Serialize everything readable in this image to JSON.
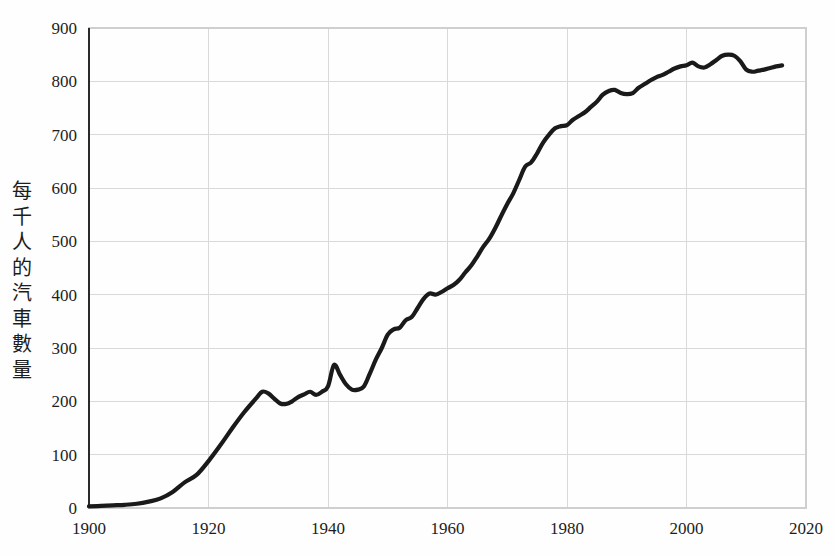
{
  "chart_data": {
    "type": "line",
    "title": "",
    "subtitle": "",
    "xlabel": "",
    "ylabel": "每千人的汽車數量",
    "ylabel_chars": [
      "每",
      "千",
      "人",
      "的",
      "汽",
      "車",
      "數",
      "量"
    ],
    "xlim": [
      1900,
      2020
    ],
    "ylim": [
      0,
      900
    ],
    "grid": true,
    "legend_position": "none",
    "line_color": "#1a1a1a",
    "grid_color": "#d9d9d9",
    "background_color": "#fefefe",
    "xticks": [
      1900,
      1920,
      1940,
      1960,
      1980,
      2000,
      2020
    ],
    "xtick_labels": [
      "1900",
      "1920",
      "1940",
      "1960",
      "1980",
      "2000",
      "2020"
    ],
    "yticks": [
      0,
      100,
      200,
      300,
      400,
      500,
      600,
      700,
      800,
      900
    ],
    "ytick_labels": [
      "0",
      "100",
      "200",
      "300",
      "400",
      "500",
      "600",
      "700",
      "800",
      "900"
    ],
    "series": [
      {
        "name": "每千人的汽車數量",
        "x": [
          1900,
          1902,
          1904,
          1906,
          1908,
          1910,
          1912,
          1914,
          1916,
          1918,
          1920,
          1922,
          1924,
          1926,
          1928,
          1929,
          1930,
          1931,
          1932,
          1933,
          1934,
          1935,
          1936,
          1937,
          1938,
          1939,
          1940,
          1941,
          1942,
          1943,
          1944,
          1945,
          1946,
          1947,
          1948,
          1949,
          1950,
          1951,
          1952,
          1953,
          1954,
          1955,
          1956,
          1957,
          1958,
          1959,
          1960,
          1961,
          1962,
          1963,
          1964,
          1965,
          1966,
          1967,
          1968,
          1969,
          1970,
          1971,
          1972,
          1973,
          1974,
          1975,
          1976,
          1977,
          1978,
          1979,
          1980,
          1981,
          1982,
          1983,
          1984,
          1985,
          1986,
          1987,
          1988,
          1989,
          1990,
          1991,
          1992,
          1993,
          1994,
          1995,
          1996,
          1997,
          1998,
          1999,
          2000,
          2001,
          2002,
          2003,
          2004,
          2005,
          2006,
          2007,
          2008,
          2009,
          2010,
          2011,
          2012,
          2013,
          2014,
          2015,
          2016
        ],
        "values": [
          3,
          4,
          5,
          6,
          8,
          12,
          18,
          30,
          48,
          62,
          88,
          118,
          150,
          180,
          206,
          218,
          215,
          205,
          196,
          195,
          200,
          208,
          213,
          218,
          212,
          218,
          228,
          268,
          250,
          232,
          222,
          222,
          228,
          252,
          278,
          300,
          325,
          335,
          338,
          352,
          358,
          375,
          392,
          402,
          400,
          405,
          412,
          418,
          428,
          442,
          455,
          472,
          490,
          505,
          525,
          548,
          570,
          590,
          615,
          640,
          648,
          665,
          685,
          700,
          712,
          716,
          718,
          728,
          735,
          742,
          752,
          762,
          775,
          782,
          784,
          778,
          776,
          778,
          788,
          795,
          802,
          808,
          812,
          818,
          824,
          828,
          830,
          835,
          828,
          826,
          832,
          840,
          848,
          850,
          848,
          838,
          822,
          818,
          820,
          822,
          825,
          828,
          830
        ]
      }
    ]
  },
  "axis": {
    "x_tick_names": [
      "xtick-1900",
      "xtick-1920",
      "xtick-1940",
      "xtick-1960",
      "xtick-1980",
      "xtick-2000",
      "xtick-2020"
    ],
    "y_tick_names": [
      "ytick-0",
      "ytick-100",
      "ytick-200",
      "ytick-300",
      "ytick-400",
      "ytick-500",
      "ytick-600",
      "ytick-700",
      "ytick-800",
      "ytick-900"
    ]
  }
}
